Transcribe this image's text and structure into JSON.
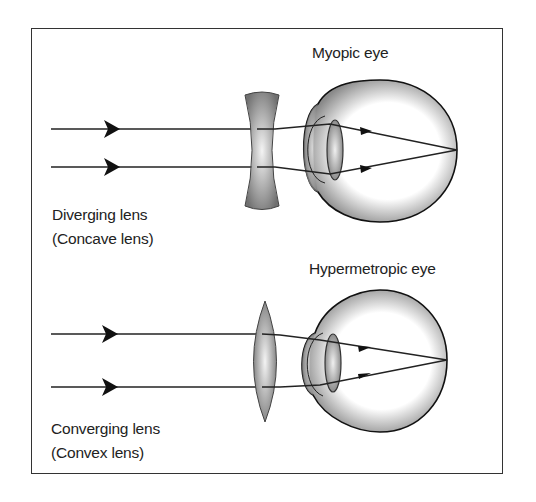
{
  "figure": {
    "top_panel": {
      "title": "Myopic eye",
      "lens_label_line1": "Diverging lens",
      "lens_label_line2": "(Concave lens)",
      "lens_type": "concave"
    },
    "bottom_panel": {
      "title": "Hypermetropic eye",
      "lens_label_line1": "Converging lens",
      "lens_label_line2": "(Convex lens)",
      "lens_type": "convex"
    },
    "colors": {
      "frame": "#333333",
      "ray": "#222222",
      "lens_fill_dark": "#777777",
      "lens_fill_light": "#f2f2f2"
    }
  }
}
